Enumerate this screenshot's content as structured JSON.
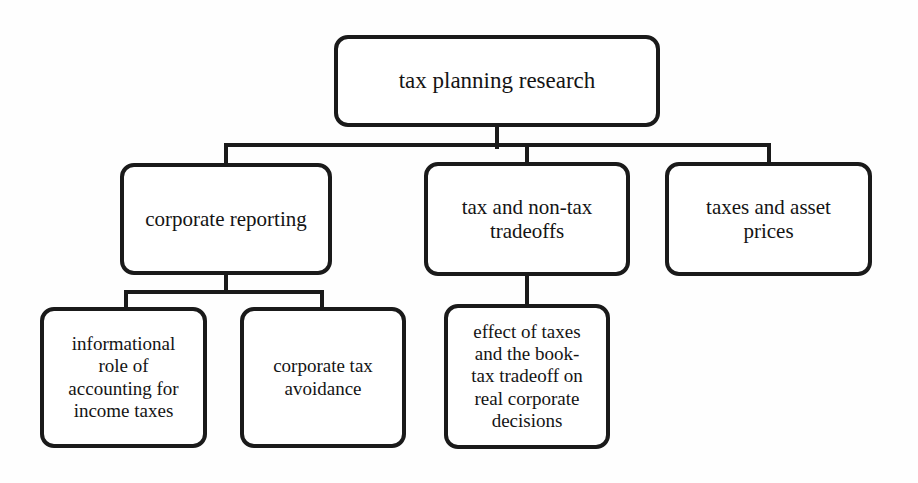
{
  "diagram": {
    "type": "hierarchy-tree",
    "title": "tax planning research",
    "background_color": "#fefefe",
    "node_fill_color": "#ffffff",
    "node_border_color": "#1a1a1a",
    "text_color": "#141414",
    "connector_color": "#1a1a1a"
  },
  "nodes": {
    "root": {
      "label": "tax planning research",
      "level": 0
    },
    "corporate_reporting": {
      "label": "corporate reporting",
      "level": 1
    },
    "tradeoffs": {
      "label": "tax and non-tax\ntradeoffs",
      "level": 1
    },
    "asset_prices": {
      "label": "taxes and asset\nprices",
      "level": 1
    },
    "informational_role": {
      "label": "informational\nrole of\naccounting for\nincome taxes",
      "level": 2
    },
    "tax_avoidance": {
      "label": "corporate tax\navoidance",
      "level": 2
    },
    "real_decisions": {
      "label": "effect of taxes\nand the book-\ntax tradeoff on\nreal corporate\ndecisions",
      "level": 2
    }
  },
  "edges": [
    {
      "from": "root",
      "to": "corporate_reporting"
    },
    {
      "from": "root",
      "to": "tradeoffs"
    },
    {
      "from": "root",
      "to": "asset_prices"
    },
    {
      "from": "corporate_reporting",
      "to": "informational_role"
    },
    {
      "from": "corporate_reporting",
      "to": "tax_avoidance"
    },
    {
      "from": "tradeoffs",
      "to": "real_decisions"
    }
  ]
}
